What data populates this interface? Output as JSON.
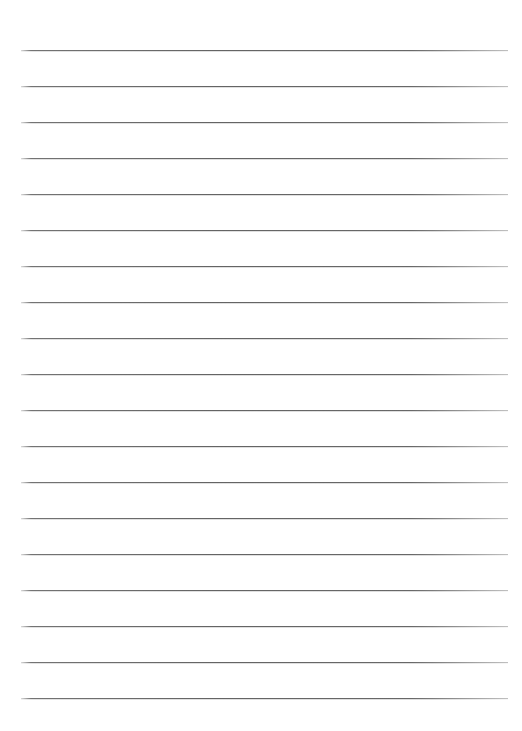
{
  "document": {
    "type": "lined-paper-template",
    "title": "Lined Paper Template",
    "orientation": "portrait",
    "page_width_px": 522,
    "page_height_px": 731,
    "background_color": "#ffffff"
  },
  "ruling": {
    "line_count": 19,
    "line_color": "#646464",
    "line_thickness_px": 1,
    "line_spacing_px": 36,
    "first_line_y_px": 50,
    "last_line_y_px": 698,
    "left_margin_px": 21,
    "right_margin_px": 14,
    "line_left_x_px": 21,
    "line_right_x_px": 508,
    "line_width_px": 487,
    "lines": [
      {
        "index": 1,
        "y_px": 50
      },
      {
        "index": 2,
        "y_px": 86
      },
      {
        "index": 3,
        "y_px": 122
      },
      {
        "index": 4,
        "y_px": 158
      },
      {
        "index": 5,
        "y_px": 194
      },
      {
        "index": 6,
        "y_px": 230
      },
      {
        "index": 7,
        "y_px": 266
      },
      {
        "index": 8,
        "y_px": 302
      },
      {
        "index": 9,
        "y_px": 338
      },
      {
        "index": 10,
        "y_px": 374
      },
      {
        "index": 11,
        "y_px": 410
      },
      {
        "index": 12,
        "y_px": 446
      },
      {
        "index": 13,
        "y_px": 482
      },
      {
        "index": 14,
        "y_px": 518
      },
      {
        "index": 15,
        "y_px": 554
      },
      {
        "index": 16,
        "y_px": 590
      },
      {
        "index": 17,
        "y_px": 626
      },
      {
        "index": 18,
        "y_px": 662
      },
      {
        "index": 19,
        "y_px": 698
      }
    ]
  },
  "content": {
    "text_entries": [],
    "header_text": "",
    "footer_text": ""
  }
}
